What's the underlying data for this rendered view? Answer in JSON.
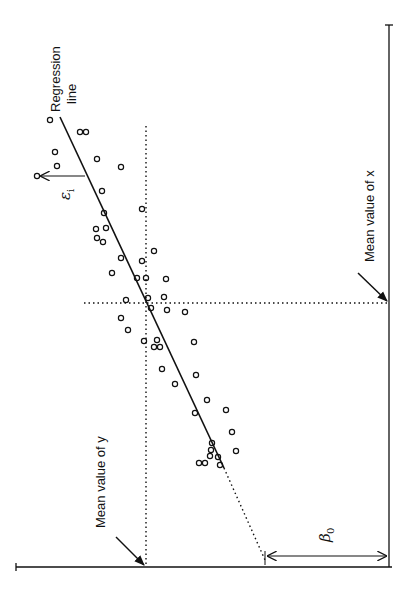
{
  "figure": {
    "orientation": "rotated 90 degrees counter-clockwise",
    "labels": {
      "regression_line_1": "Regression",
      "regression_line_2": "line",
      "mean_x": "Mean value of x",
      "mean_y": "Mean value of y",
      "residual_symbol": "ε",
      "residual_sub": "i",
      "intercept_symbol": "β",
      "intercept_sub": "0"
    },
    "colors": {
      "ink": "#111111",
      "background": "#ffffff"
    }
  },
  "chart_data": {
    "type": "scatter",
    "title": "",
    "xlabel": "x",
    "ylabel": "y",
    "annotations": [
      "Regression line",
      "Mean value of x",
      "Mean value of y",
      "ε_i (residual)",
      "β0 (intercept)"
    ],
    "grid": false,
    "legend": "none",
    "note": "Points given in screen pixel coordinates of the rotated figure (sx, sy). Data x increases downward (upward in figure frame), data y increases leftward.",
    "points_screen": [
      [
        50,
        120
      ],
      [
        80,
        132
      ],
      [
        86,
        132
      ],
      [
        55,
        152
      ],
      [
        57,
        166
      ],
      [
        37,
        176
      ],
      [
        97,
        159
      ],
      [
        121,
        167
      ],
      [
        102,
        191
      ],
      [
        104,
        213
      ],
      [
        142,
        209
      ],
      [
        96,
        229
      ],
      [
        106,
        228
      ],
      [
        97,
        238
      ],
      [
        103,
        242
      ],
      [
        121,
        258
      ],
      [
        142,
        261
      ],
      [
        154,
        251
      ],
      [
        112,
        273
      ],
      [
        137,
        278
      ],
      [
        146,
        278
      ],
      [
        166,
        279
      ],
      [
        126,
        300
      ],
      [
        148,
        298
      ],
      [
        164,
        297
      ],
      [
        151,
        308
      ],
      [
        167,
        310
      ],
      [
        185,
        312
      ],
      [
        121,
        318
      ],
      [
        128,
        330
      ],
      [
        144,
        341
      ],
      [
        157,
        340
      ],
      [
        154,
        347
      ],
      [
        160,
        347
      ],
      [
        194,
        342
      ],
      [
        162,
        369
      ],
      [
        175,
        384
      ],
      [
        196,
        375
      ],
      [
        207,
        400
      ],
      [
        195,
        413
      ],
      [
        226,
        410
      ],
      [
        212,
        443
      ],
      [
        232,
        432
      ],
      [
        211,
        450
      ],
      [
        210,
        456
      ],
      [
        218,
        457
      ],
      [
        236,
        451
      ],
      [
        199,
        463
      ],
      [
        205,
        463
      ],
      [
        220,
        465
      ]
    ],
    "regression_line_screen": {
      "start": [
        60,
        117
      ],
      "end": [
        224,
        468
      ],
      "extrapolated_to": [
        265,
        560
      ]
    },
    "mean_x_screen_y": 303,
    "mean_y_screen_x": 146,
    "x_axis_screen": {
      "x": 389,
      "y1": 25,
      "y2": 567
    },
    "y_axis_screen": {
      "y": 567,
      "x1": 16,
      "x2": 392
    },
    "residual_screen": {
      "from": [
        85,
        176
      ],
      "to": [
        37,
        176
      ]
    },
    "intercept_screen": {
      "from": [
        389,
        556
      ],
      "to": [
        265,
        556
      ]
    }
  }
}
